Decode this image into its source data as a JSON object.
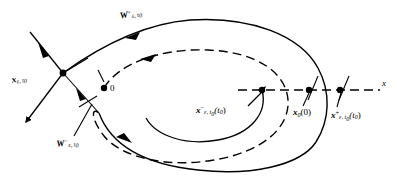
{
  "figure": {
    "background_color": "#ffffff",
    "stroke_color": "#000000",
    "width": 402,
    "height": 187
  },
  "labels": {
    "w_unstable": {
      "text": "W",
      "sup": "+",
      "sub": "ε, t",
      "sub2": "0",
      "full": "W⁺ₑ,ₜ₀"
    },
    "x_epsilon": {
      "text": "x",
      "sub": "ε, t",
      "sub2": "0",
      "full": "xₑ,ₜ₀"
    },
    "origin": {
      "text": "0"
    },
    "w_stable": {
      "text": "W",
      "sup": "−",
      "sub": "ε, t",
      "sub2": "0",
      "full": "W⁻ₑ,ₜ₀"
    },
    "x_minus": {
      "text": "x",
      "sup": "−",
      "sub": "ε, t",
      "sub2": "0",
      "arg": "(t",
      "arg2": "0",
      "arg3": ")",
      "full": "x⁻ₑ,ₜ₀(t₀)"
    },
    "x_zero": {
      "text": "x",
      "sub": "0",
      "arg": "(0)",
      "full": "x₀(0)"
    },
    "x_plus": {
      "text": "x",
      "sup": "+",
      "sub": "ε, t",
      "sub2": "0",
      "arg": "(t",
      "arg2": "0",
      "arg3": ")",
      "full": "x⁺ₑ,ₜ₀(t₀)"
    },
    "axis": {
      "text": "x"
    }
  },
  "geometry": {
    "saddle_point": {
      "x": 63,
      "y": 73
    },
    "origin_point": {
      "x": 103,
      "y": 88
    },
    "marked_points": [
      {
        "name": "x-minus-point",
        "x": 262,
        "y": 90
      },
      {
        "name": "x-zero-point",
        "x": 309,
        "y": 90
      },
      {
        "name": "x-plus-point",
        "x": 340,
        "y": 90
      }
    ],
    "secondary_point": {
      "x": 81,
      "y": 97
    },
    "axis_line": {
      "y": 90,
      "x_start": 240,
      "x_end": 380,
      "style": "dashed"
    }
  }
}
